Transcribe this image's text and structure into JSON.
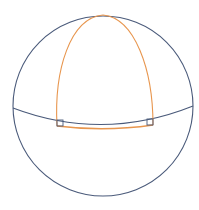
{
  "diagram": {
    "title": "",
    "colors": {
      "sphere": "#4a5a7a",
      "triangle": "#e8964e",
      "background": "#ffffff"
    },
    "sphere": {
      "cx": 103,
      "cy": 106,
      "r": 90
    },
    "equator_path": "M 13 108 Q 103 142 193 106",
    "triangle": {
      "apex": [
        103,
        15
      ],
      "left_vertex": [
        57,
        126
      ],
      "right_vertex": [
        153,
        125
      ],
      "left_side_path": "M 57 126 C 54 70 70 18 103 15",
      "right_side_path": "M 153 125 C 153 70 135 18 103 15",
      "base_path": "M 57 126 Q 105 132 153 125"
    },
    "right_angle_markers": [
      {
        "label": "left-right-angle",
        "x": 57,
        "y": 120,
        "size": 6
      },
      {
        "label": "right-right-angle",
        "x": 147,
        "y": 119,
        "size": 6
      }
    ]
  }
}
